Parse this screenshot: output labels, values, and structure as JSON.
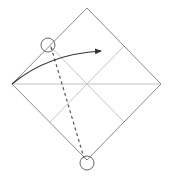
{
  "diagram": {
    "type": "origami-fold-step",
    "description": "Square paper rotated as a diamond with crease lines; fold the left corner toward the right along the dashed valley line connecting two circled reference points.",
    "colors": {
      "background": "#ffffff",
      "outline": "#8a8a8a",
      "crease": "#c4c4c4",
      "fold_line": "#555555",
      "arrow": "#333333",
      "marker": "#666666"
    },
    "paper": {
      "vertices": {
        "top": [
          87,
          8
        ],
        "right": [
          161,
          84
        ],
        "bottom": [
          87,
          160
        ],
        "left": [
          12,
          84
        ]
      }
    },
    "creases": [
      {
        "name": "horizontal-diagonal",
        "from": [
          12,
          84
        ],
        "to": [
          161,
          84
        ]
      },
      {
        "name": "crease-topleft-to-bottomright",
        "from": [
          50,
          46
        ],
        "to": [
          124,
          122
        ]
      },
      {
        "name": "crease-topright-to-bottomleft",
        "from": [
          124,
          46
        ],
        "to": [
          50,
          122
        ]
      }
    ],
    "fold_line": {
      "style": "dashed",
      "from": [
        51,
        47
      ],
      "to": [
        84,
        158
      ]
    },
    "markers": [
      {
        "name": "reference-circle-top",
        "center": [
          48,
          45
        ],
        "radius": 7
      },
      {
        "name": "reference-circle-bottom",
        "center": [
          87,
          163
        ],
        "radius": 7
      }
    ],
    "arrow": {
      "name": "fold-direction-arrow",
      "from": [
        12,
        84
      ],
      "control": [
        48,
        54
      ],
      "to": [
        101,
        51
      ]
    }
  }
}
